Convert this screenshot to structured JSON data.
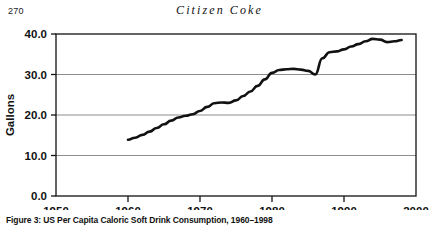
{
  "page": {
    "number": "270",
    "running_head": "Citizen Coke"
  },
  "caption": {
    "text": "Figure 3: US Per Capita Caloric Soft Drink Consumption, 1960–1998"
  },
  "chart_data": {
    "type": "line",
    "title": "",
    "xlabel": "",
    "ylabel": "Gallons",
    "xlim": [
      1950,
      2000
    ],
    "ylim": [
      0,
      40
    ],
    "xticks": [
      1950,
      1960,
      1970,
      1980,
      1990,
      2000
    ],
    "xtick_labels": [
      "1950",
      "1960",
      "1970",
      "1980",
      "1990",
      "2000"
    ],
    "yticks": [
      0,
      10,
      20,
      30,
      40
    ],
    "ytick_labels": [
      "0.0",
      "10.0",
      "20.0",
      "30.0",
      "40.0"
    ],
    "grid": "horizontal",
    "legend": "none",
    "line_color": "#111111",
    "line_width": 2.6,
    "series": [
      {
        "name": "US per capita caloric soft drink consumption",
        "x": [
          1960,
          1961,
          1962,
          1963,
          1964,
          1965,
          1966,
          1967,
          1968,
          1969,
          1970,
          1971,
          1972,
          1973,
          1974,
          1975,
          1976,
          1977,
          1978,
          1979,
          1980,
          1981,
          1982,
          1983,
          1984,
          1985,
          1986,
          1987,
          1988,
          1989,
          1990,
          1991,
          1992,
          1993,
          1994,
          1995,
          1996,
          1997,
          1998
        ],
        "values": [
          13.9,
          14.4,
          15.1,
          15.9,
          16.8,
          17.7,
          18.6,
          19.4,
          19.8,
          20.2,
          21.0,
          22.0,
          22.9,
          23.1,
          23.0,
          23.6,
          24.7,
          25.8,
          27.2,
          28.8,
          30.4,
          31.1,
          31.3,
          31.4,
          31.2,
          30.9,
          30.0,
          34.0,
          35.5,
          35.7,
          36.2,
          36.9,
          37.5,
          38.2,
          38.8,
          38.6,
          38.0,
          38.2,
          38.5
        ]
      }
    ]
  }
}
